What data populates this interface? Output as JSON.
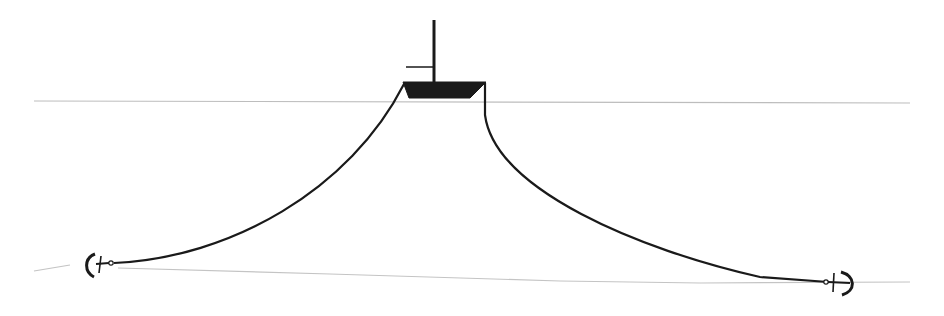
{
  "diagram": {
    "type": "mooring-diagram",
    "canvas": {
      "width": 944,
      "height": 316,
      "background": "#ffffff"
    },
    "colors": {
      "line": "#1a1a1a",
      "hull": "#1a1a1a",
      "water_surface": "#bdbdbd",
      "seabed": "#c4c4c4"
    },
    "elements": [
      {
        "id": "water-surface",
        "kind": "line",
        "from": [
          34,
          101
        ],
        "to": [
          910,
          103
        ]
      },
      {
        "id": "seabed",
        "kind": "line",
        "from": [
          34,
          271
        ],
        "to": [
          910,
          284
        ],
        "note": "sloping, slightly higher on left"
      },
      {
        "id": "vessel-hull",
        "kind": "trapezoid",
        "top_left": [
          404,
          82
        ],
        "top_right": [
          485,
          82
        ],
        "bottom_right": [
          468,
          97
        ],
        "bottom_left": [
          408,
          97
        ]
      },
      {
        "id": "mast",
        "kind": "line",
        "from": [
          434,
          20
        ],
        "to": [
          434,
          82
        ]
      },
      {
        "id": "flag-arm",
        "kind": "line",
        "from": [
          406,
          67
        ],
        "to": [
          434,
          67
        ]
      },
      {
        "id": "left-mooring-line",
        "kind": "curve",
        "from": [
          403,
          83
        ],
        "to": [
          112,
          263
        ]
      },
      {
        "id": "right-mooring-line",
        "kind": "curve",
        "from": [
          484,
          83
        ],
        "to": [
          828,
          282
        ]
      },
      {
        "id": "left-anchor",
        "kind": "anchor",
        "at": [
          98,
          265
        ],
        "facing": "left"
      },
      {
        "id": "right-anchor",
        "kind": "anchor",
        "at": [
          840,
          283
        ],
        "facing": "right"
      }
    ]
  }
}
